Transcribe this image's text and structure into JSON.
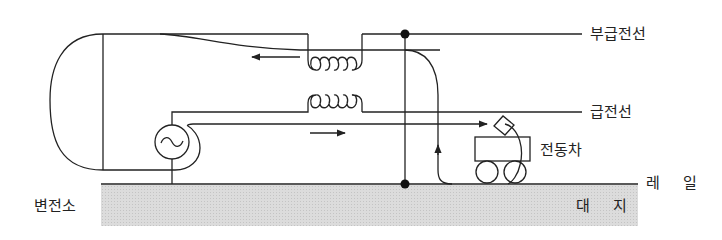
{
  "diagram": {
    "labels": {
      "negative_feeder": "부급전선",
      "feeder": "급전선",
      "electric_car": "전동차",
      "rail": "레 일",
      "earth": "대 지",
      "substation": "변전소"
    },
    "components": {
      "ac_source_symbol": "~",
      "transformer_coils": 2,
      "junction_dots": 2
    },
    "colors": {
      "line": "#222222",
      "ground_fill": "#d9d9d9",
      "background": "#ffffff"
    }
  }
}
